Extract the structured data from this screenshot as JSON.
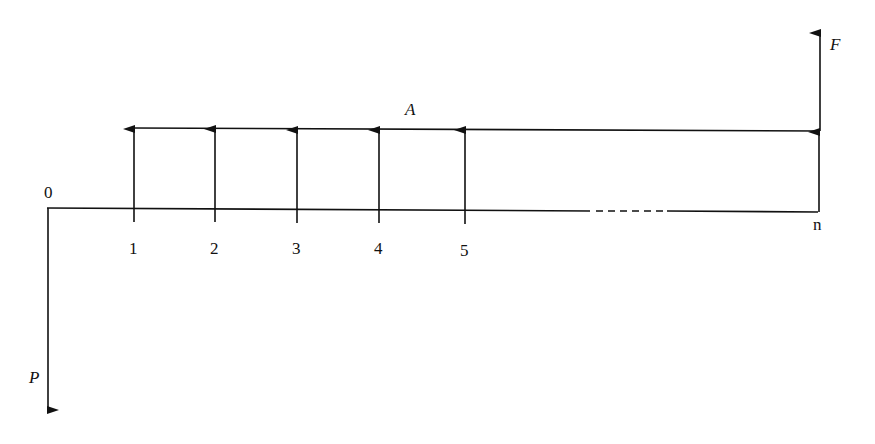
{
  "diagram": {
    "type": "cash-flow diagram",
    "origin_label": "0",
    "period_labels": [
      "1",
      "2",
      "3",
      "4",
      "5"
    ],
    "final_period_label": "n",
    "annuity_label": "A",
    "present_value_label": "P",
    "future_value_label": "F",
    "colors": {
      "line": "#111111",
      "background": "#ffffff"
    }
  }
}
